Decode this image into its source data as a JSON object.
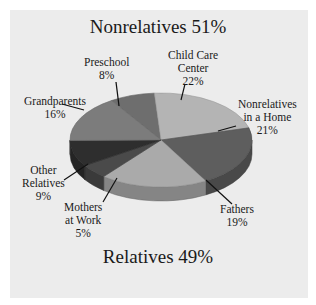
{
  "chart_data": {
    "type": "pie",
    "title": "Nonrelatives 51%",
    "subtitle": "Relatives 49%",
    "categories": [
      "Preschool",
      "Child Care Center",
      "Nonrelatives in a Home",
      "Fathers",
      "Mothers at Work",
      "Other Relatives",
      "Grandparents"
    ],
    "values": [
      8,
      22,
      21,
      19,
      5,
      9,
      16
    ],
    "groups": [
      {
        "name": "Nonrelatives",
        "percent": 51,
        "members": [
          "Preschool",
          "Child Care Center",
          "Nonrelatives in a Home"
        ]
      },
      {
        "name": "Relatives",
        "percent": 49,
        "members": [
          "Fathers",
          "Mothers at Work",
          "Other Relatives",
          "Grandparents"
        ]
      }
    ],
    "style": "3d-pie",
    "legend": "none (direct labels with leader lines)"
  },
  "titles": {
    "top": "Nonrelatives 51%",
    "bottom": "Relatives 49%"
  },
  "labels": {
    "preschool": {
      "line1": "Preschool",
      "pct": "8%"
    },
    "child_care": {
      "line1": "Child Care",
      "line2": "Center",
      "pct": "22%"
    },
    "nonrel_home": {
      "line1": "Nonrelatives",
      "line2": "in a Home",
      "pct": "21%"
    },
    "fathers": {
      "line1": "Fathers",
      "pct": "19%"
    },
    "mothers": {
      "line1": "Mothers",
      "line2": "at Work",
      "pct": "5%"
    },
    "other_rel": {
      "line1": "Other",
      "line2": "Relatives",
      "pct": "9%"
    },
    "grandparents": {
      "line1": "Grandparents",
      "pct": "16%"
    }
  },
  "colors": {
    "panel_bg": "#ececec",
    "preschool": "#6e6e6e",
    "child_care": "#b4b4b4",
    "nonrel_home": "#5e5e5e",
    "fathers": "#aaaaaa",
    "mothers": "#4a4a4a",
    "other_rel": "#2e2e2e",
    "grandparents": "#7c7c7c"
  }
}
